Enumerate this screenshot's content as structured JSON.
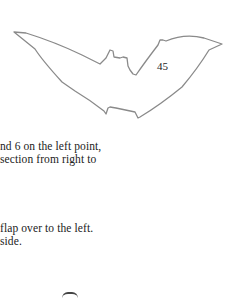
{
  "figure": {
    "name": "bat-outline-illustration",
    "page_number": "45"
  },
  "text": {
    "line1": "nd 6 on the left point,",
    "line2": " section from right to",
    "line3": " flap over to the left.",
    "line4": "side."
  },
  "colors": {
    "outline": "#8a8a8a",
    "text": "#222222",
    "background": "#ffffff"
  }
}
